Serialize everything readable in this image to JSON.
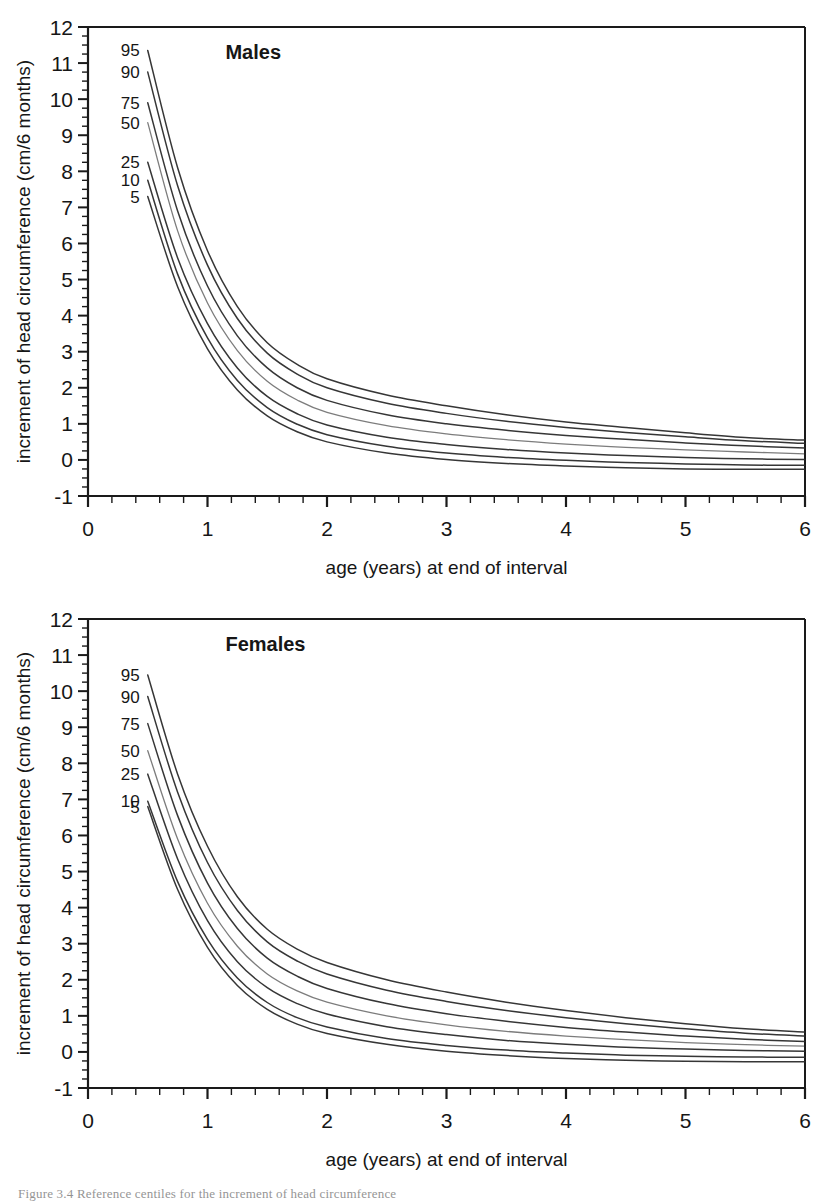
{
  "figure": {
    "caption": "Figure 3.4  Reference centiles for the increment of head circumference"
  },
  "panels": [
    {
      "id": "males",
      "title": "Males",
      "xlabel": "age (years) at end of interval",
      "ylabel": "increment of head circumference (cm/6 months)",
      "xticks": [
        "0",
        "1",
        "2",
        "3",
        "4",
        "5",
        "6"
      ],
      "yticks": [
        "-1",
        "0",
        "1",
        "2",
        "3",
        "4",
        "5",
        "6",
        "7",
        "8",
        "9",
        "10",
        "11",
        "12"
      ],
      "percentile_labels": [
        "95",
        "90",
        "75",
        "50",
        "25",
        "10",
        "5"
      ]
    },
    {
      "id": "females",
      "title": "Females",
      "xlabel": "age (years) at end of interval",
      "ylabel": "increment of head circumference (cm/6 months)",
      "xticks": [
        "0",
        "1",
        "2",
        "3",
        "4",
        "5",
        "6"
      ],
      "yticks": [
        "-1",
        "0",
        "1",
        "2",
        "3",
        "4",
        "5",
        "6",
        "7",
        "8",
        "9",
        "10",
        "11",
        "12"
      ],
      "percentile_labels": [
        "95",
        "90",
        "75",
        "50",
        "25",
        "10",
        "5"
      ]
    }
  ],
  "chart_data": [
    {
      "type": "line",
      "title": "Males",
      "xlabel": "age (years) at end of interval",
      "ylabel": "increment of head circumference (cm/6 months)",
      "xlim": [
        0,
        6
      ],
      "ylim": [
        -1,
        12
      ],
      "xticks": [
        0,
        1,
        2,
        3,
        4,
        5,
        6
      ],
      "yticks": [
        -1,
        0,
        1,
        2,
        3,
        4,
        5,
        6,
        7,
        8,
        9,
        10,
        11,
        12
      ],
      "minor_tick_step_x": 0.2,
      "minor_tick_step_y": 0.25,
      "grid": false,
      "legend": "inline-curve-labels-left",
      "x": [
        0.5,
        0.75,
        1.0,
        1.25,
        1.5,
        1.75,
        2.0,
        2.5,
        3.0,
        3.5,
        4.0,
        4.5,
        5.0,
        5.5,
        6.0
      ],
      "series": [
        {
          "name": "95",
          "values": [
            11.35,
            8.1,
            5.8,
            4.25,
            3.25,
            2.65,
            2.25,
            1.8,
            1.5,
            1.25,
            1.05,
            0.9,
            0.75,
            0.62,
            0.55
          ]
        },
        {
          "name": "90",
          "values": [
            10.75,
            7.6,
            5.4,
            3.92,
            2.96,
            2.38,
            2.0,
            1.57,
            1.29,
            1.07,
            0.9,
            0.76,
            0.64,
            0.53,
            0.46
          ]
        },
        {
          "name": "75",
          "values": [
            9.9,
            6.9,
            4.82,
            3.44,
            2.55,
            2.0,
            1.65,
            1.25,
            1.0,
            0.82,
            0.68,
            0.57,
            0.47,
            0.39,
            0.33
          ]
        },
        {
          "name": "50",
          "values": [
            9.35,
            6.35,
            4.35,
            3.03,
            2.18,
            1.66,
            1.32,
            0.95,
            0.72,
            0.56,
            0.44,
            0.35,
            0.28,
            0.22,
            0.17
          ]
        },
        {
          "name": "25",
          "values": [
            8.25,
            5.6,
            3.78,
            2.55,
            1.76,
            1.28,
            0.97,
            0.63,
            0.43,
            0.29,
            0.19,
            0.12,
            0.07,
            0.03,
            0.01
          ]
        },
        {
          "name": "10",
          "values": [
            7.75,
            5.15,
            3.38,
            2.2,
            1.45,
            0.99,
            0.7,
            0.38,
            0.19,
            0.07,
            -0.01,
            -0.07,
            -0.11,
            -0.14,
            -0.15
          ]
        },
        {
          "name": "5",
          "values": [
            7.3,
            4.8,
            3.08,
            1.94,
            1.22,
            0.78,
            0.5,
            0.19,
            0.01,
            -0.1,
            -0.17,
            -0.22,
            -0.25,
            -0.26,
            -0.26
          ]
        }
      ]
    },
    {
      "type": "line",
      "title": "Females",
      "xlabel": "age (years) at end of interval",
      "ylabel": "increment of head circumference (cm/6 months)",
      "xlim": [
        0,
        6
      ],
      "ylim": [
        -1,
        12
      ],
      "xticks": [
        0,
        1,
        2,
        3,
        4,
        5,
        6
      ],
      "yticks": [
        -1,
        0,
        1,
        2,
        3,
        4,
        5,
        6,
        7,
        8,
        9,
        10,
        11,
        12
      ],
      "minor_tick_step_x": 0.2,
      "minor_tick_step_y": 0.25,
      "grid": false,
      "legend": "inline-curve-labels-left",
      "x": [
        0.5,
        0.75,
        1.0,
        1.25,
        1.5,
        1.75,
        2.0,
        2.5,
        3.0,
        3.5,
        4.0,
        4.5,
        5.0,
        5.5,
        6.0
      ],
      "series": [
        {
          "name": "95",
          "values": [
            10.45,
            7.7,
            5.7,
            4.3,
            3.4,
            2.85,
            2.48,
            2.0,
            1.66,
            1.38,
            1.15,
            0.95,
            0.78,
            0.64,
            0.55
          ]
        },
        {
          "name": "90",
          "values": [
            9.85,
            7.2,
            5.25,
            3.92,
            3.05,
            2.52,
            2.16,
            1.71,
            1.4,
            1.15,
            0.95,
            0.78,
            0.64,
            0.52,
            0.44
          ]
        },
        {
          "name": "75",
          "values": [
            9.1,
            6.55,
            4.68,
            3.42,
            2.6,
            2.1,
            1.76,
            1.34,
            1.06,
            0.85,
            0.68,
            0.55,
            0.44,
            0.35,
            0.29
          ]
        },
        {
          "name": "50",
          "values": [
            8.35,
            5.9,
            4.12,
            2.93,
            2.16,
            1.69,
            1.38,
            1.0,
            0.75,
            0.57,
            0.44,
            0.34,
            0.26,
            0.2,
            0.16
          ]
        },
        {
          "name": "25",
          "values": [
            7.7,
            5.35,
            3.64,
            2.5,
            1.78,
            1.34,
            1.05,
            0.7,
            0.48,
            0.32,
            0.21,
            0.13,
            0.08,
            0.04,
            0.02
          ]
        },
        {
          "name": "10",
          "values": [
            6.95,
            4.72,
            3.12,
            2.05,
            1.37,
            0.95,
            0.69,
            0.37,
            0.18,
            0.05,
            -0.03,
            -0.09,
            -0.12,
            -0.14,
            -0.15
          ]
        },
        {
          "name": "5",
          "values": [
            6.8,
            4.5,
            2.9,
            1.84,
            1.18,
            0.77,
            0.51,
            0.21,
            0.02,
            -0.1,
            -0.18,
            -0.23,
            -0.26,
            -0.27,
            -0.27
          ]
        }
      ]
    }
  ]
}
